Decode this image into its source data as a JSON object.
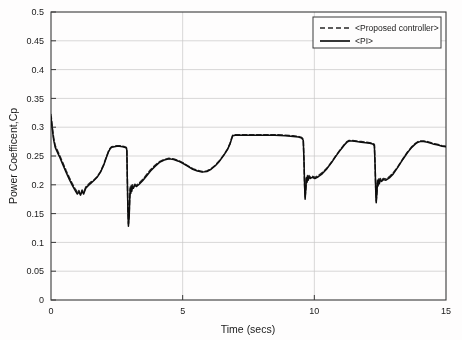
{
  "chart_data": {
    "type": "line",
    "title": "",
    "xlabel": "Time (secs)",
    "ylabel": "Power Coefficent,Cp",
    "xlim": [
      0,
      15
    ],
    "ylim": [
      0,
      0.5
    ],
    "xticks": [
      0,
      5,
      10,
      15
    ],
    "xtick_labels": [
      "0",
      "5",
      "10",
      "15"
    ],
    "yticks": [
      0,
      0.05,
      0.1,
      0.15,
      0.2,
      0.25,
      0.3,
      0.35,
      0.4,
      0.45,
      0.5
    ],
    "ytick_labels": [
      "0",
      "0.05",
      "0.1",
      "0.15",
      "0.2",
      "0.25",
      "0.3",
      "0.35",
      "0.4",
      "0.45",
      "0.5"
    ],
    "grid": true,
    "legend_position": "top-right",
    "legend": [
      {
        "name": "<Proposed controller>",
        "style": "dashed",
        "color": "#262626"
      },
      {
        "name": "<PI>",
        "style": "solid",
        "color": "#111111"
      }
    ],
    "series": [
      {
        "name": "<Proposed controller>",
        "style": "dashed",
        "color": "#2b2b2b",
        "points": [
          [
            0.0,
            0.322
          ],
          [
            0.05,
            0.3
          ],
          [
            0.1,
            0.282
          ],
          [
            0.16,
            0.268
          ],
          [
            0.22,
            0.262
          ],
          [
            0.32,
            0.252
          ],
          [
            0.45,
            0.238
          ],
          [
            0.58,
            0.224
          ],
          [
            0.7,
            0.212
          ],
          [
            0.82,
            0.201
          ],
          [
            0.92,
            0.193
          ],
          [
            1.0,
            0.187
          ],
          [
            1.06,
            0.19
          ],
          [
            1.12,
            0.184
          ],
          [
            1.18,
            0.191
          ],
          [
            1.24,
            0.186
          ],
          [
            1.32,
            0.196
          ],
          [
            1.42,
            0.201
          ],
          [
            1.52,
            0.205
          ],
          [
            1.62,
            0.208
          ],
          [
            1.75,
            0.214
          ],
          [
            1.88,
            0.223
          ],
          [
            2.0,
            0.235
          ],
          [
            2.1,
            0.248
          ],
          [
            2.18,
            0.258
          ],
          [
            2.24,
            0.263
          ],
          [
            2.3,
            0.266
          ],
          [
            2.4,
            0.267
          ],
          [
            2.5,
            0.268
          ],
          [
            2.6,
            0.268
          ],
          [
            2.72,
            0.267
          ],
          [
            2.8,
            0.266
          ],
          [
            2.86,
            0.265
          ],
          [
            2.88,
            0.262
          ],
          [
            2.9,
            0.21
          ],
          [
            2.92,
            0.16
          ],
          [
            2.94,
            0.132
          ],
          [
            2.97,
            0.15
          ],
          [
            2.99,
            0.178
          ],
          [
            3.01,
            0.196
          ],
          [
            3.03,
            0.188
          ],
          [
            3.05,
            0.199
          ],
          [
            3.07,
            0.192
          ],
          [
            3.09,
            0.2
          ],
          [
            3.13,
            0.196
          ],
          [
            3.18,
            0.201
          ],
          [
            3.25,
            0.199
          ],
          [
            3.35,
            0.203
          ],
          [
            3.48,
            0.209
          ],
          [
            3.62,
            0.217
          ],
          [
            3.78,
            0.226
          ],
          [
            3.95,
            0.234
          ],
          [
            4.12,
            0.24
          ],
          [
            4.3,
            0.244
          ],
          [
            4.48,
            0.246
          ],
          [
            4.66,
            0.245
          ],
          [
            4.84,
            0.242
          ],
          [
            5.02,
            0.238
          ],
          [
            5.2,
            0.233
          ],
          [
            5.38,
            0.228
          ],
          [
            5.56,
            0.225
          ],
          [
            5.74,
            0.223
          ],
          [
            5.92,
            0.224
          ],
          [
            6.08,
            0.228
          ],
          [
            6.24,
            0.234
          ],
          [
            6.4,
            0.242
          ],
          [
            6.56,
            0.252
          ],
          [
            6.7,
            0.262
          ],
          [
            6.8,
            0.272
          ],
          [
            6.86,
            0.281
          ],
          [
            6.9,
            0.286
          ],
          [
            7.0,
            0.287
          ],
          [
            7.3,
            0.287
          ],
          [
            7.7,
            0.287
          ],
          [
            8.1,
            0.287
          ],
          [
            8.5,
            0.287
          ],
          [
            8.9,
            0.286
          ],
          [
            9.2,
            0.285
          ],
          [
            9.4,
            0.284
          ],
          [
            9.52,
            0.282
          ],
          [
            9.58,
            0.279
          ],
          [
            9.61,
            0.24
          ],
          [
            9.63,
            0.2
          ],
          [
            9.65,
            0.178
          ],
          [
            9.68,
            0.196
          ],
          [
            9.7,
            0.214
          ],
          [
            9.72,
            0.206
          ],
          [
            9.74,
            0.216
          ],
          [
            9.77,
            0.21
          ],
          [
            9.8,
            0.216
          ],
          [
            9.85,
            0.213
          ],
          [
            9.92,
            0.215
          ],
          [
            10.02,
            0.213
          ],
          [
            10.15,
            0.216
          ],
          [
            10.3,
            0.221
          ],
          [
            10.48,
            0.229
          ],
          [
            10.66,
            0.24
          ],
          [
            10.84,
            0.252
          ],
          [
            11.0,
            0.262
          ],
          [
            11.14,
            0.27
          ],
          [
            11.24,
            0.275
          ],
          [
            11.32,
            0.277
          ],
          [
            11.45,
            0.277
          ],
          [
            11.6,
            0.276
          ],
          [
            11.78,
            0.275
          ],
          [
            11.95,
            0.274
          ],
          [
            12.1,
            0.273
          ],
          [
            12.22,
            0.272
          ],
          [
            12.28,
            0.27
          ],
          [
            12.31,
            0.232
          ],
          [
            12.33,
            0.195
          ],
          [
            12.35,
            0.172
          ],
          [
            12.38,
            0.19
          ],
          [
            12.4,
            0.208
          ],
          [
            12.42,
            0.2
          ],
          [
            12.44,
            0.21
          ],
          [
            12.47,
            0.204
          ],
          [
            12.5,
            0.211
          ],
          [
            12.55,
            0.208
          ],
          [
            12.62,
            0.211
          ],
          [
            12.72,
            0.21
          ],
          [
            12.85,
            0.214
          ],
          [
            13.0,
            0.221
          ],
          [
            13.18,
            0.232
          ],
          [
            13.36,
            0.245
          ],
          [
            13.54,
            0.257
          ],
          [
            13.7,
            0.266
          ],
          [
            13.84,
            0.272
          ],
          [
            13.94,
            0.275
          ],
          [
            14.02,
            0.276
          ],
          [
            14.15,
            0.276
          ],
          [
            14.3,
            0.275
          ],
          [
            14.5,
            0.272
          ],
          [
            14.7,
            0.27
          ],
          [
            14.85,
            0.268
          ],
          [
            15.0,
            0.267
          ]
        ]
      },
      {
        "name": "<PI>",
        "style": "solid",
        "color": "#0d0d0d",
        "points": [
          [
            0.0,
            0.318
          ],
          [
            0.05,
            0.296
          ],
          [
            0.1,
            0.278
          ],
          [
            0.16,
            0.265
          ],
          [
            0.22,
            0.259
          ],
          [
            0.32,
            0.249
          ],
          [
            0.45,
            0.235
          ],
          [
            0.58,
            0.221
          ],
          [
            0.7,
            0.209
          ],
          [
            0.82,
            0.198
          ],
          [
            0.92,
            0.19
          ],
          [
            1.0,
            0.184
          ],
          [
            1.06,
            0.188
          ],
          [
            1.12,
            0.182
          ],
          [
            1.18,
            0.189
          ],
          [
            1.24,
            0.184
          ],
          [
            1.32,
            0.194
          ],
          [
            1.42,
            0.199
          ],
          [
            1.52,
            0.203
          ],
          [
            1.62,
            0.207
          ],
          [
            1.75,
            0.213
          ],
          [
            1.88,
            0.222
          ],
          [
            2.0,
            0.234
          ],
          [
            2.1,
            0.247
          ],
          [
            2.18,
            0.257
          ],
          [
            2.24,
            0.262
          ],
          [
            2.3,
            0.265
          ],
          [
            2.4,
            0.266
          ],
          [
            2.5,
            0.267
          ],
          [
            2.6,
            0.267
          ],
          [
            2.72,
            0.266
          ],
          [
            2.8,
            0.265
          ],
          [
            2.86,
            0.264
          ],
          [
            2.88,
            0.26
          ],
          [
            2.9,
            0.205
          ],
          [
            2.92,
            0.155
          ],
          [
            2.94,
            0.128
          ],
          [
            2.97,
            0.146
          ],
          [
            2.99,
            0.175
          ],
          [
            3.01,
            0.193
          ],
          [
            3.03,
            0.185
          ],
          [
            3.05,
            0.196
          ],
          [
            3.07,
            0.189
          ],
          [
            3.09,
            0.197
          ],
          [
            3.13,
            0.194
          ],
          [
            3.18,
            0.199
          ],
          [
            3.25,
            0.197
          ],
          [
            3.35,
            0.201
          ],
          [
            3.48,
            0.207
          ],
          [
            3.62,
            0.215
          ],
          [
            3.78,
            0.224
          ],
          [
            3.95,
            0.232
          ],
          [
            4.12,
            0.239
          ],
          [
            4.3,
            0.243
          ],
          [
            4.48,
            0.245
          ],
          [
            4.66,
            0.244
          ],
          [
            4.84,
            0.241
          ],
          [
            5.02,
            0.237
          ],
          [
            5.2,
            0.232
          ],
          [
            5.38,
            0.227
          ],
          [
            5.56,
            0.224
          ],
          [
            5.74,
            0.222
          ],
          [
            5.92,
            0.223
          ],
          [
            6.08,
            0.227
          ],
          [
            6.24,
            0.233
          ],
          [
            6.4,
            0.241
          ],
          [
            6.56,
            0.251
          ],
          [
            6.7,
            0.261
          ],
          [
            6.8,
            0.271
          ],
          [
            6.86,
            0.28
          ],
          [
            6.9,
            0.285
          ],
          [
            7.0,
            0.286
          ],
          [
            7.3,
            0.286
          ],
          [
            7.7,
            0.286
          ],
          [
            8.1,
            0.286
          ],
          [
            8.5,
            0.286
          ],
          [
            8.9,
            0.285
          ],
          [
            9.2,
            0.284
          ],
          [
            9.4,
            0.283
          ],
          [
            9.52,
            0.281
          ],
          [
            9.58,
            0.277
          ],
          [
            9.61,
            0.238
          ],
          [
            9.63,
            0.198
          ],
          [
            9.65,
            0.175
          ],
          [
            9.68,
            0.194
          ],
          [
            9.7,
            0.212
          ],
          [
            9.72,
            0.204
          ],
          [
            9.74,
            0.214
          ],
          [
            9.77,
            0.208
          ],
          [
            9.8,
            0.214
          ],
          [
            9.85,
            0.211
          ],
          [
            9.92,
            0.213
          ],
          [
            10.02,
            0.211
          ],
          [
            10.15,
            0.214
          ],
          [
            10.3,
            0.219
          ],
          [
            10.48,
            0.228
          ],
          [
            10.66,
            0.239
          ],
          [
            10.84,
            0.251
          ],
          [
            11.0,
            0.261
          ],
          [
            11.14,
            0.269
          ],
          [
            11.24,
            0.274
          ],
          [
            11.32,
            0.276
          ],
          [
            11.45,
            0.276
          ],
          [
            11.6,
            0.275
          ],
          [
            11.78,
            0.274
          ],
          [
            11.95,
            0.273
          ],
          [
            12.1,
            0.272
          ],
          [
            12.22,
            0.271
          ],
          [
            12.28,
            0.268
          ],
          [
            12.31,
            0.23
          ],
          [
            12.33,
            0.192
          ],
          [
            12.35,
            0.169
          ],
          [
            12.38,
            0.188
          ],
          [
            12.4,
            0.206
          ],
          [
            12.42,
            0.198
          ],
          [
            12.44,
            0.208
          ],
          [
            12.47,
            0.202
          ],
          [
            12.5,
            0.209
          ],
          [
            12.55,
            0.206
          ],
          [
            12.62,
            0.209
          ],
          [
            12.72,
            0.208
          ],
          [
            12.85,
            0.212
          ],
          [
            13.0,
            0.219
          ],
          [
            13.18,
            0.231
          ],
          [
            13.36,
            0.244
          ],
          [
            13.54,
            0.256
          ],
          [
            13.7,
            0.265
          ],
          [
            13.84,
            0.271
          ],
          [
            13.94,
            0.274
          ],
          [
            14.02,
            0.275
          ],
          [
            14.15,
            0.275
          ],
          [
            14.3,
            0.274
          ],
          [
            14.5,
            0.271
          ],
          [
            14.7,
            0.269
          ],
          [
            14.85,
            0.267
          ],
          [
            15.0,
            0.266
          ]
        ]
      }
    ]
  }
}
